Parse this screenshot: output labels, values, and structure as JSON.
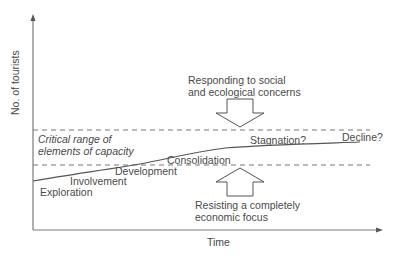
{
  "diagram": {
    "type": "tourism-area-life-cycle",
    "y_axis": {
      "label": "No. of tourists"
    },
    "x_axis": {
      "label": "Time"
    },
    "capacity_band": {
      "label_line1": "Critical range of",
      "label_line2": "elements of capacity"
    },
    "stages": [
      {
        "name": "Exploration"
      },
      {
        "name": "Involvement"
      },
      {
        "name": "Development"
      },
      {
        "name": "Consolidation"
      },
      {
        "name": "Stagnation?"
      },
      {
        "name": "Decline?"
      }
    ],
    "pressures": {
      "downward": {
        "line1": "Responding to social",
        "line2": "and ecological concerns",
        "direction": "down"
      },
      "upward": {
        "line1": "Resisting a completely",
        "line2": "economic focus",
        "direction": "up"
      }
    },
    "colors": {
      "lines": "#555555",
      "text": "#4a4a4a",
      "background": "#ffffff"
    }
  }
}
